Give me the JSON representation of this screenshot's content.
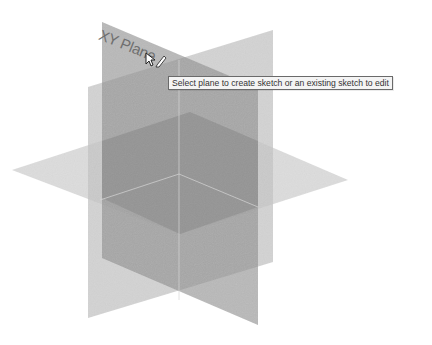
{
  "viewport": {
    "background": "#ffffff",
    "planes": [
      {
        "name": "YZ Plane",
        "color": "#b4b4b4",
        "opacity": 0.55
      },
      {
        "name": "XZ Plane",
        "color": "#c2c2c2",
        "opacity": 0.55
      },
      {
        "name": "XY Plane",
        "color": "#8f8f8f",
        "opacity": 0.7
      }
    ],
    "hovered_plane_label": "XY Plane",
    "cursor": "select-pointer-with-sketch-icon"
  },
  "tooltip": {
    "text": "Select plane to create sketch or an existing sketch to edit"
  }
}
